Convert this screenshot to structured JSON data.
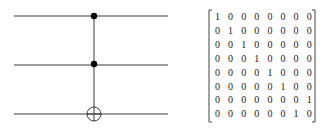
{
  "circuit": {
    "gate": "Toffoli (CCNOT)",
    "wires": [
      {
        "index": 0,
        "role": "control"
      },
      {
        "index": 1,
        "role": "control"
      },
      {
        "index": 2,
        "role": "target"
      }
    ]
  },
  "matrix": {
    "rows": [
      [
        "1",
        "0",
        "0",
        "0",
        "0",
        "0",
        "0",
        "0"
      ],
      [
        "0",
        "1",
        "0",
        "0",
        "0",
        "0",
        "0",
        "0"
      ],
      [
        "0",
        "0",
        "1",
        "0",
        "0",
        "0",
        "0",
        "0"
      ],
      [
        "0",
        "0",
        "0",
        "1",
        "0",
        "0",
        "0",
        "0"
      ],
      [
        "0",
        "0",
        "0",
        "0",
        "1",
        "0",
        "0",
        "0"
      ],
      [
        "0",
        "0",
        "0",
        "0",
        "0",
        "1",
        "0",
        "0"
      ],
      [
        "0",
        "0",
        "0",
        "0",
        "0",
        "0",
        "0",
        "1"
      ],
      [
        "0",
        "0",
        "0",
        "0",
        "0",
        "0",
        "1",
        "0"
      ]
    ]
  },
  "colors": {
    "line": "#3a3a3a",
    "text": "#222222"
  }
}
